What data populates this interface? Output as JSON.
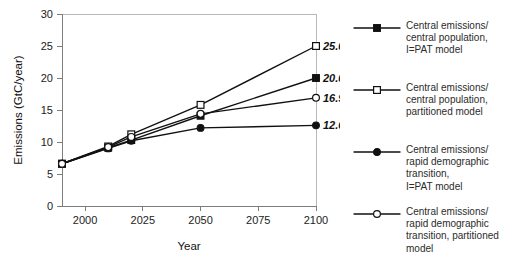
{
  "chart_data": {
    "type": "line",
    "title": "",
    "xlabel": "Year",
    "ylabel": "Emissions (GtC/year)",
    "xlim": [
      1990,
      2100
    ],
    "ylim": [
      0,
      30
    ],
    "xticks": [
      "2000",
      "2025",
      "2050",
      "2075",
      "2100"
    ],
    "xtick_values": [
      2000,
      2025,
      2050,
      2075,
      2100
    ],
    "yticks": [
      "0",
      "5",
      "10",
      "15",
      "20",
      "25",
      "30"
    ],
    "ytick_values": [
      0,
      5,
      10,
      15,
      20,
      25,
      30
    ],
    "grid": false,
    "legend_position": "right",
    "x": [
      1990,
      2010,
      2020,
      2050,
      2100
    ],
    "series": [
      {
        "name": "Central emissions/\ncentral population,\nI=PAT model",
        "marker": "filled-square",
        "values": [
          6.6,
          9.1,
          10.3,
          14.1,
          20.0
        ],
        "endpoint_label": "20.0"
      },
      {
        "name": "Central emissions/\ncentral population,\npartitioned model",
        "marker": "open-square",
        "values": [
          6.6,
          9.3,
          11.2,
          15.8,
          25.0
        ],
        "endpoint_label": "25.0"
      },
      {
        "name": "Central emissions/\nrapid demographic\ntransition,\nI=PAT model",
        "marker": "filled-circle",
        "values": [
          6.6,
          9.0,
          10.2,
          12.2,
          12.6
        ],
        "endpoint_label": "12.6"
      },
      {
        "name": "Central emissions/\nrapid demographic\ntransition, partitioned\nmodel",
        "marker": "open-circle",
        "values": [
          6.6,
          9.2,
          10.8,
          14.4,
          16.9
        ],
        "endpoint_label": "16.9"
      }
    ],
    "endpoint_labels": [
      "25.0",
      "20.0",
      "16.9",
      "12.6"
    ],
    "colors": {
      "line": "#111111",
      "axis": "#7d7d7d",
      "text": "#222222",
      "background": "#ffffff"
    }
  },
  "legend": {
    "entries": [
      {
        "marker": "filled-square",
        "label": "Central emissions/\ncentral population,\nI=PAT model"
      },
      {
        "marker": "open-square",
        "label": "Central emissions/\ncentral population,\npartitioned model"
      },
      {
        "marker": "filled-circle",
        "label": "Central emissions/\nrapid demographic\ntransition,\nI=PAT model"
      },
      {
        "marker": "open-circle",
        "label": "Central emissions/\nrapid demographic\ntransition, partitioned\nmodel"
      }
    ]
  }
}
